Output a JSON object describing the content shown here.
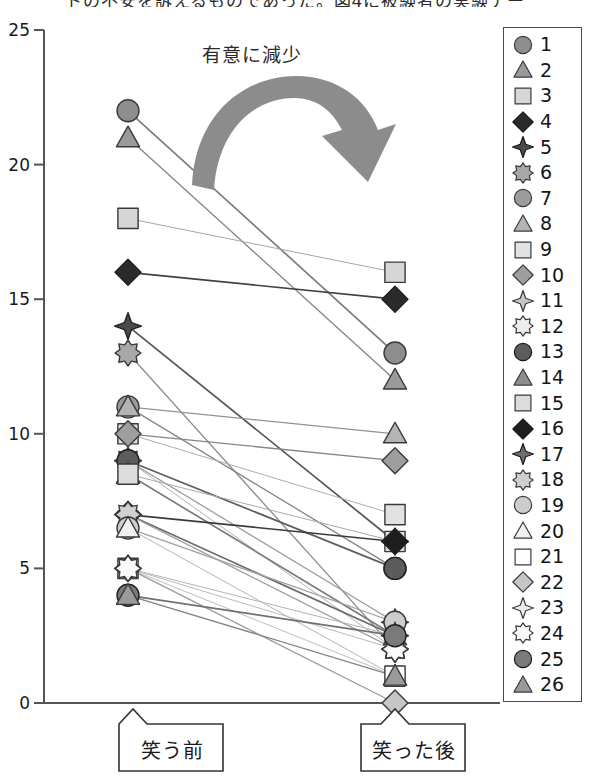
{
  "title_clipped": "トの不安を訴えるものであった。図4に被験者の実験デー",
  "annotation": {
    "arrow_label": "有意に減少",
    "arrow_name": "significant-decrease-arrow",
    "arrow_color": "#8c8c8c"
  },
  "axis": {
    "y_ticks": [
      "0",
      "5",
      "10",
      "15",
      "20",
      "25"
    ],
    "y_min": 0,
    "y_max": 25,
    "axis_color": "#555555"
  },
  "callouts": [
    {
      "label": "笑う前",
      "name": "callout-before-laughing"
    },
    {
      "label": "笑った後",
      "name": "callout-after-laughing"
    }
  ],
  "legend": {
    "entries": [
      {
        "label": "1",
        "shape": "circle",
        "fill": "#8e8e8e"
      },
      {
        "label": "2",
        "shape": "triangle",
        "fill": "#9a9a9a"
      },
      {
        "label": "3",
        "shape": "square",
        "fill": "#d6d6d6"
      },
      {
        "label": "4",
        "shape": "diamond",
        "fill": "#2a2a2a"
      },
      {
        "label": "5",
        "shape": "star4",
        "fill": "#4a4a4a"
      },
      {
        "label": "6",
        "shape": "star8",
        "fill": "#a8a8a8"
      },
      {
        "label": "7",
        "shape": "circle",
        "fill": "#9c9c9c"
      },
      {
        "label": "8",
        "shape": "triangle",
        "fill": "#b4b4b4"
      },
      {
        "label": "9",
        "shape": "square",
        "fill": "#e2e2e2"
      },
      {
        "label": "10",
        "shape": "diamond",
        "fill": "#9e9e9e"
      },
      {
        "label": "11",
        "shape": "star4",
        "fill": "#c4c4c4"
      },
      {
        "label": "12",
        "shape": "star8",
        "fill": "#ededed"
      },
      {
        "label": "13",
        "shape": "circle",
        "fill": "#5c5c5c"
      },
      {
        "label": "14",
        "shape": "triangle",
        "fill": "#8e8e8e"
      },
      {
        "label": "15",
        "shape": "square",
        "fill": "#dcdcdc"
      },
      {
        "label": "16",
        "shape": "diamond",
        "fill": "#1e1e1e"
      },
      {
        "label": "17",
        "shape": "star4",
        "fill": "#6e6e6e"
      },
      {
        "label": "18",
        "shape": "star8",
        "fill": "#d0d0d0"
      },
      {
        "label": "19",
        "shape": "circle",
        "fill": "#cdcdcd"
      },
      {
        "label": "20",
        "shape": "triangle",
        "fill": "#f0f0f0"
      },
      {
        "label": "21",
        "shape": "square",
        "fill": "#ffffff"
      },
      {
        "label": "22",
        "shape": "diamond",
        "fill": "#c6c6c6"
      },
      {
        "label": "23",
        "shape": "star4",
        "fill": "#ededed"
      },
      {
        "label": "24",
        "shape": "star8",
        "fill": "#fafafa"
      },
      {
        "label": "25",
        "shape": "circle",
        "fill": "#7a7a7a"
      },
      {
        "label": "26",
        "shape": "triangle",
        "fill": "#9a9a9a"
      }
    ]
  },
  "chart_data": {
    "type": "line",
    "title": "",
    "xlabel": "",
    "ylabel": "",
    "categories": [
      "笑う前",
      "笑った後"
    ],
    "ylim": [
      0,
      25
    ],
    "grid": false,
    "legend_position": "right",
    "note": "paired slope chart: 26 subjects measured before and after laughing; all values decrease",
    "series": [
      {
        "name": "1",
        "shape": "circle",
        "fill": "#8e8e8e",
        "values": [
          22,
          13
        ]
      },
      {
        "name": "2",
        "shape": "triangle",
        "fill": "#9a9a9a",
        "values": [
          21,
          12
        ]
      },
      {
        "name": "3",
        "shape": "square",
        "fill": "#d6d6d6",
        "values": [
          18,
          16
        ]
      },
      {
        "name": "4",
        "shape": "diamond",
        "fill": "#2a2a2a",
        "values": [
          16,
          15
        ]
      },
      {
        "name": "5",
        "shape": "star4",
        "fill": "#4a4a4a",
        "values": [
          14,
          6
        ]
      },
      {
        "name": "6",
        "shape": "star8",
        "fill": "#a8a8a8",
        "values": [
          13,
          2
        ]
      },
      {
        "name": "7",
        "shape": "circle",
        "fill": "#9c9c9c",
        "values": [
          11,
          5
        ]
      },
      {
        "name": "8",
        "shape": "triangle",
        "fill": "#b4b4b4",
        "values": [
          11,
          10
        ]
      },
      {
        "name": "9",
        "shape": "square",
        "fill": "#e2e2e2",
        "values": [
          10,
          7
        ]
      },
      {
        "name": "10",
        "shape": "diamond",
        "fill": "#9e9e9e",
        "values": [
          10,
          9
        ]
      },
      {
        "name": "11",
        "shape": "star4",
        "fill": "#c4c4c4",
        "values": [
          9,
          3
        ]
      },
      {
        "name": "12",
        "shape": "star8",
        "fill": "#ededed",
        "values": [
          9,
          2
        ]
      },
      {
        "name": "13",
        "shape": "circle",
        "fill": "#5c5c5c",
        "values": [
          9,
          5
        ]
      },
      {
        "name": "14",
        "shape": "triangle",
        "fill": "#8e8e8e",
        "values": [
          8.5,
          2.5
        ]
      },
      {
        "name": "15",
        "shape": "square",
        "fill": "#dcdcdc",
        "values": [
          8.5,
          6
        ]
      },
      {
        "name": "16",
        "shape": "diamond",
        "fill": "#1e1e1e",
        "values": [
          7,
          6
        ]
      },
      {
        "name": "17",
        "shape": "star4",
        "fill": "#6e6e6e",
        "values": [
          7,
          2.5
        ]
      },
      {
        "name": "18",
        "shape": "star8",
        "fill": "#d0d0d0",
        "values": [
          7,
          2
        ]
      },
      {
        "name": "19",
        "shape": "circle",
        "fill": "#cdcdcd",
        "values": [
          6.5,
          3
        ]
      },
      {
        "name": "20",
        "shape": "triangle",
        "fill": "#f0f0f0",
        "values": [
          6.5,
          1
        ]
      },
      {
        "name": "21",
        "shape": "square",
        "fill": "#ffffff",
        "values": [
          5,
          1
        ]
      },
      {
        "name": "22",
        "shape": "diamond",
        "fill": "#c6c6c6",
        "values": [
          5,
          0
        ]
      },
      {
        "name": "23",
        "shape": "star4",
        "fill": "#ededed",
        "values": [
          5,
          2.5
        ]
      },
      {
        "name": "24",
        "shape": "star8",
        "fill": "#fafafa",
        "values": [
          5,
          2
        ]
      },
      {
        "name": "25",
        "shape": "circle",
        "fill": "#7a7a7a",
        "values": [
          4,
          2.5
        ]
      },
      {
        "name": "26",
        "shape": "triangle",
        "fill": "#9a9a9a",
        "values": [
          4,
          1
        ]
      }
    ]
  }
}
